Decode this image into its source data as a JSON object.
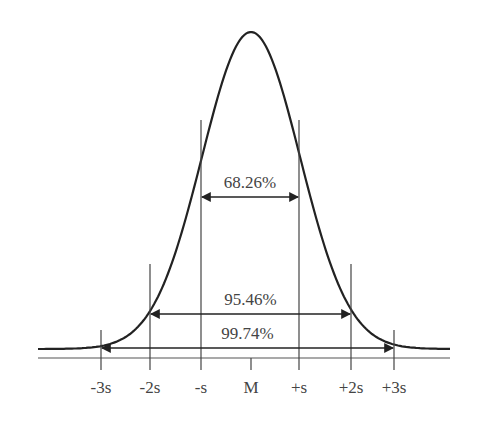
{
  "diagram": {
    "curve_color": "#222222",
    "line_color": "#444444",
    "baseline_y": 358,
    "axis_ticks": [
      {
        "id": "minus-3s",
        "label": "-3s",
        "x": 101,
        "top": 330
      },
      {
        "id": "minus-2s",
        "label": "-2s",
        "x": 150,
        "top": 264
      },
      {
        "id": "minus-s",
        "label": "-s",
        "x": 201,
        "top": 120
      },
      {
        "id": "mean",
        "label": "M",
        "x": 251,
        "top": 358
      },
      {
        "id": "plus-s",
        "label": "+s",
        "x": 299,
        "top": 120
      },
      {
        "id": "plus-2s",
        "label": "+2s",
        "x": 351,
        "top": 264
      },
      {
        "id": "plus-3s",
        "label": "+3s",
        "x": 394,
        "top": 330
      }
    ],
    "intervals": [
      {
        "id": "one-sigma",
        "label": "68.26%",
        "x1": 201,
        "x2": 299,
        "y": 197
      },
      {
        "id": "two-sigma",
        "label": "95.46%",
        "x1": 150,
        "x2": 351,
        "y": 314
      },
      {
        "id": "three-sigma",
        "label": "99.74%",
        "x1": 101,
        "x2": 394,
        "y": 348
      }
    ]
  }
}
